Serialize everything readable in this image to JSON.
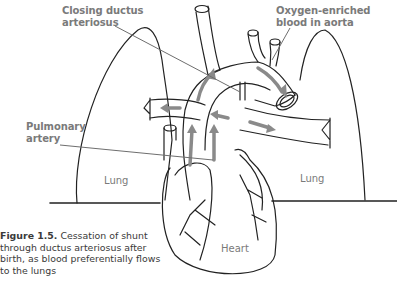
{
  "labels": {
    "closing_ductus": [
      "Closing ductus",
      "arteriosus"
    ],
    "oxygen_blood": [
      "Oxygen-enriched",
      "blood in aorta"
    ],
    "pulmonary_artery": [
      "Pulmonary",
      "artery"
    ],
    "lung_left": "Lung",
    "lung_right": "Lung",
    "heart": "Heart"
  },
  "caption": {
    "figure_number": "Figure 1.5.",
    "text": " Cessation of shunt through ductus arteriosus after birth, as blood preferentially flows to the lungs"
  },
  "colors": {
    "line": "#222222",
    "arrow": "#8a8a8a",
    "label": "#7a7a7a",
    "leader": "#6e6e6e"
  }
}
